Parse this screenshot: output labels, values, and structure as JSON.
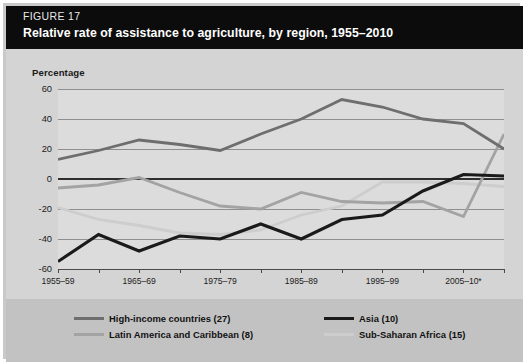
{
  "figure": {
    "number": "FIGURE 17",
    "title": "Relative rate of assistance to agriculture, by region, 1955–2010"
  },
  "colors": {
    "header_bg": "#0c0c0c",
    "body_bg": "#d4d4d4",
    "plot_bg": "#dcdcdc",
    "legend_bg": "#c2c2c2",
    "grid": "#8f8f8f",
    "zero_line": "#2e2e2e",
    "high_income": "#6e6e6e",
    "latin_america": "#a3a3a3",
    "asia": "#1a1a1a",
    "sub_saharan": "#cdcdcd"
  },
  "chart_data": {
    "type": "line",
    "title": "Relative rate of assistance to agriculture, by region, 1955–2010",
    "xlabel": "",
    "ylabel": "Percentage",
    "ylim": [
      -60,
      60
    ],
    "yticks": [
      60,
      40,
      20,
      0,
      -20,
      -40,
      -60
    ],
    "ytick_labels": [
      "60",
      "40",
      "20",
      "0",
      "-20",
      "-40",
      "-60"
    ],
    "grid": true,
    "legend_position": "bottom",
    "categories": [
      "1955–59",
      "1960–64",
      "1965–69",
      "1970–74",
      "1975–79",
      "1980–84",
      "1985–89",
      "1990–94",
      "1995–99",
      "2000–04",
      "2005–10*",
      ""
    ],
    "xtick_labels": [
      "1955–59",
      "1965–69",
      "1975–79",
      "1985–89",
      "1995–99",
      "2005–10*"
    ],
    "x": [
      0,
      1,
      2,
      3,
      4,
      5,
      6,
      7,
      8,
      9,
      10,
      11
    ],
    "series": [
      {
        "name": "High-income countries (27)",
        "count": 27,
        "color": "#6e6e6e",
        "values": [
          13,
          19,
          26,
          23,
          19,
          30,
          40,
          53,
          48,
          40,
          37,
          20
        ]
      },
      {
        "name": "Latin America and Caribbean (8)",
        "count": 8,
        "color": "#a3a3a3",
        "values": [
          -6,
          -4,
          1,
          -9,
          -18,
          -20,
          -9,
          -15,
          -16,
          -15,
          -25,
          30
        ]
      },
      {
        "name": "Asia (10)",
        "count": 10,
        "color": "#1a1a1a",
        "values": [
          -55,
          -37,
          -48,
          -38,
          -40,
          -30,
          -40,
          -27,
          -24,
          -8,
          3,
          2
        ]
      },
      {
        "name": "Sub-Saharan Africa (15)",
        "count": 15,
        "color": "#cdcdcd",
        "values": [
          -19,
          -27,
          -31,
          -36,
          -37,
          -34,
          -24,
          -18,
          -2,
          -2,
          -3,
          -5
        ]
      }
    ]
  },
  "legend": {
    "items": [
      {
        "label": "High-income countries (27)",
        "color": "#6e6e6e"
      },
      {
        "label": "Latin America and Caribbean (8)",
        "color": "#a3a3a3"
      },
      {
        "label": "Asia (10)",
        "color": "#1a1a1a"
      },
      {
        "label": "Sub-Saharan Africa (15)",
        "color": "#cdcdcd"
      }
    ]
  }
}
